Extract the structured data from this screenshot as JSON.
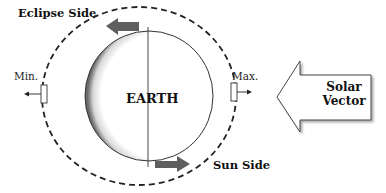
{
  "diagram": {
    "labels": {
      "eclipse_side": "Eclipse Side",
      "sun_side": "Sun Side",
      "earth": "EARTH",
      "min": "Min.",
      "max": "Max.",
      "solar_vector_line1": "Solar",
      "solar_vector_line2": "Vector"
    },
    "colors": {
      "motion_arrow": "#5f5f5f",
      "orbit_dash": "#222222",
      "earth_outline": "#333333",
      "text": "#111111"
    },
    "elements": {
      "orbit": "dashed-ellipse",
      "earth": "circle-with-shaded-left-edge",
      "axis": "vertical-line",
      "top_arrow_direction": "left",
      "bottom_arrow_direction": "right",
      "solar_vector_direction": "left"
    }
  }
}
